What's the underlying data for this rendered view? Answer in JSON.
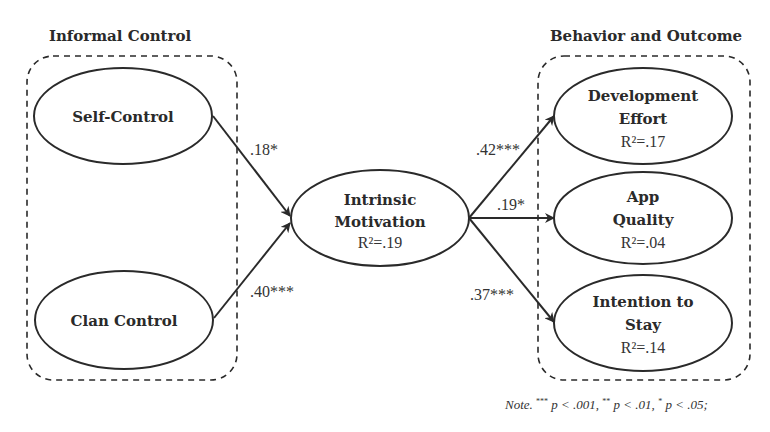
{
  "groups": {
    "left": {
      "title": "Informal Control"
    },
    "right": {
      "title": "Behavior and Outcome"
    }
  },
  "nodes": {
    "self_control": {
      "title": "Self-Control"
    },
    "clan_control": {
      "title": "Clan Control"
    },
    "intrinsic_motivation": {
      "line1": "Intrinsic",
      "line2": "Motivation",
      "r2": "R²=.19"
    },
    "development_effort": {
      "line1": "Development",
      "line2": "Effort",
      "r2": "R²=.17"
    },
    "app_quality": {
      "line1": "App",
      "line2": "Quality",
      "r2": "R²=.04"
    },
    "intention_to_stay": {
      "line1": "Intention to",
      "line2": "Stay",
      "r2": "R²=.14"
    }
  },
  "paths": {
    "self_to_motivation": ".18*",
    "clan_to_motivation": ".40***",
    "motivation_to_effort": ".42***",
    "motivation_to_quality": ".19*",
    "motivation_to_stay": ".37***"
  },
  "note": {
    "label": "Note.",
    "p001_mark": "***",
    "p001_text": " p < .001, ",
    "p01_mark": "**",
    "p01_text": " p < .01, ",
    "p05_mark": "*",
    "p05_text": " p < .05;"
  },
  "colors": {
    "stroke": "#2a2a2a",
    "background": "#ffffff"
  }
}
